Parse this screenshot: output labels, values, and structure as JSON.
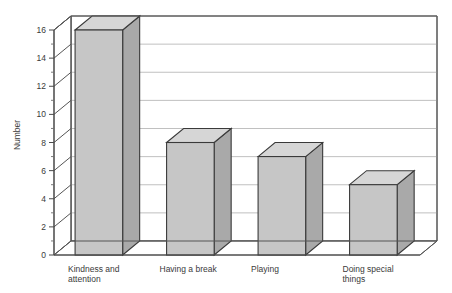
{
  "chart_data": {
    "type": "bar",
    "title": "",
    "subtitle": "",
    "xlabel": "",
    "ylabel": "Number",
    "categories": [
      "Kindness and attention",
      "Having a break",
      "Playing",
      "Doing special things"
    ],
    "values": [
      16,
      8,
      7,
      5
    ],
    "series": [
      {
        "name": "Number",
        "values": [
          16,
          8,
          7,
          5
        ]
      }
    ],
    "ylim": [
      0,
      16
    ],
    "ytick_labels": [
      "0",
      "2",
      "4",
      "6",
      "8",
      "10",
      "12",
      "14",
      "16"
    ],
    "ytick_values": [
      0,
      2,
      4,
      6,
      8,
      10,
      12,
      14,
      16
    ],
    "ytick_step": 2,
    "minor_tick_step": 1,
    "grid": "horizontal",
    "legend": "none",
    "style": "3d-bars",
    "annotations": []
  },
  "labels": {
    "y_axis_title": "Number",
    "category_lines": [
      [
        "Kindness and",
        "attention"
      ],
      [
        "Having a break"
      ],
      [
        "Playing"
      ],
      [
        "Doing special",
        "things"
      ]
    ]
  },
  "colors": {
    "bar_front": "#c6c6c6",
    "bar_top": "#d6d6d6",
    "bar_side": "#a9a9a9",
    "bar_outline": "#3a3a3a",
    "gridline": "#b9b9b9",
    "axis": "#4a4a4a",
    "background": "#ffffff",
    "text": "#3a3a3a"
  }
}
